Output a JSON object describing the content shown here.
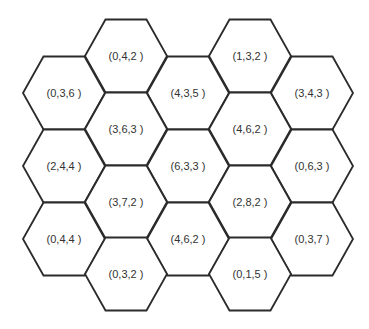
{
  "diagram": {
    "type": "hexagonal-grid",
    "hex": {
      "half_width": 41,
      "half_height": 36.5
    },
    "colors": {
      "stroke": "#2b2b2b",
      "fill": "#ffffff",
      "text": "#333333"
    },
    "cells": [
      {
        "label": "(0,4,2 )",
        "cx": 126,
        "cy": 56
      },
      {
        "label": "(1,3,2 )",
        "cx": 250,
        "cy": 56
      },
      {
        "label": "(0,3,6 )",
        "cx": 64,
        "cy": 93
      },
      {
        "label": "(4,3,5 )",
        "cx": 188,
        "cy": 93
      },
      {
        "label": "(3,4,3 )",
        "cx": 312,
        "cy": 93
      },
      {
        "label": "(3,6,3 )",
        "cx": 126,
        "cy": 129
      },
      {
        "label": "(4,6,2 )",
        "cx": 250,
        "cy": 129
      },
      {
        "label": "(2,4,4 )",
        "cx": 64,
        "cy": 166
      },
      {
        "label": "(6,3,3 )",
        "cx": 188,
        "cy": 166
      },
      {
        "label": "(0,6,3 )",
        "cx": 312,
        "cy": 166
      },
      {
        "label": "(3,7,2 )",
        "cx": 126,
        "cy": 202
      },
      {
        "label": "(2,8,2 )",
        "cx": 250,
        "cy": 202
      },
      {
        "label": "(0,4,4 )",
        "cx": 64,
        "cy": 239
      },
      {
        "label": "(4,6,2 )",
        "cx": 188,
        "cy": 239
      },
      {
        "label": "(0,3,7 )",
        "cx": 312,
        "cy": 239
      },
      {
        "label": "(0,3,2 )",
        "cx": 126,
        "cy": 274
      },
      {
        "label": "(0,1,5 )",
        "cx": 250,
        "cy": 274
      }
    ]
  }
}
